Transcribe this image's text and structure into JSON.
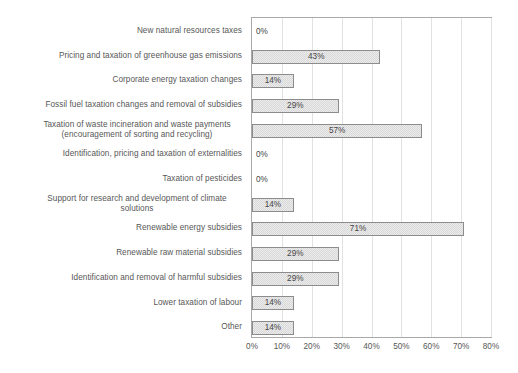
{
  "chart_data": {
    "type": "bar",
    "orientation": "horizontal",
    "title": "",
    "subtitle": "",
    "xlabel": "",
    "ylabel": "",
    "xlim": [
      0,
      80
    ],
    "xtick_labels": [
      "0%",
      "10%",
      "20%",
      "30%",
      "40%",
      "50%",
      "60%",
      "70%",
      "80%"
    ],
    "xtick_values": [
      0,
      10,
      20,
      30,
      40,
      50,
      60,
      70,
      80
    ],
    "grid": "vertical",
    "legend": "none",
    "value_label_suffix": "%",
    "categories": [
      "New natural resources taxes",
      "Pricing and taxation of greenhouse gas emissions",
      "Corporate energy taxation changes",
      "Fossil fuel taxation changes and removal of subsidies",
      "Taxation of waste incineration and waste payments\n(encouragement of sorting and recycling)",
      "Identification, pricing and taxation of externalities",
      "Taxation of pesticides",
      "Support for research and development of climate\nsolutions",
      "Renewable energy subsidies",
      "Renewable raw material subsidies",
      "Identification and removal of harmful subsidies",
      "Lower taxation of labour",
      "Other"
    ],
    "values": [
      0,
      43,
      14,
      29,
      57,
      0,
      0,
      14,
      71,
      29,
      29,
      14,
      14
    ],
    "value_labels": [
      "0%",
      "43%",
      "14%",
      "29%",
      "57%",
      "0%",
      "0%",
      "14%",
      "71%",
      "29%",
      "29%",
      "14%",
      "14%"
    ],
    "colors": {
      "bar_fill": "#d8d8d8",
      "bar_pattern": "#ececec",
      "bar_border": "#8c8c8c",
      "plot_border": "#a9a9a9",
      "gridline": "#e2e2e2",
      "text": "#575757",
      "background": "#ffffff"
    }
  }
}
